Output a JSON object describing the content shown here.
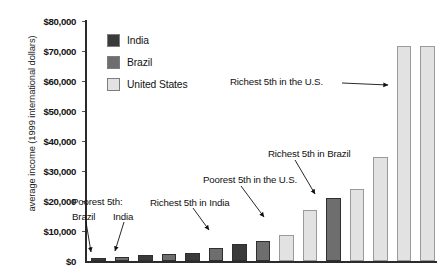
{
  "chart_data": {
    "type": "bar",
    "title": "",
    "xlabel": "",
    "ylabel": "average income (1999 international dollars)",
    "ylim": [
      0,
      80000
    ],
    "ytick_labels": [
      "$0",
      "$10,000",
      "$20,000",
      "$30,000",
      "$40,000",
      "$50,000",
      "$60,000",
      "$70,000",
      "$80,000"
    ],
    "ytick_values": [
      0,
      10000,
      20000,
      30000,
      40000,
      50000,
      60000,
      70000,
      80000
    ],
    "grid": false,
    "legend_position": "top-left",
    "legend": [
      {
        "name": "India",
        "color": "#3a3a3a"
      },
      {
        "name": "Brazil",
        "color": "#6e6e6e"
      },
      {
        "name": "United States",
        "color": "#e2e2e2"
      }
    ],
    "categories": [
      "1",
      "2",
      "3",
      "4",
      "5",
      "6",
      "7",
      "8",
      "9",
      "10",
      "11",
      "12",
      "13",
      "14",
      "15"
    ],
    "values": [
      900,
      1400,
      1900,
      2400,
      2600,
      4200,
      5700,
      6700,
      8400,
      16800,
      20800,
      24000,
      34500,
      71500,
      71500
    ],
    "bars": [
      {
        "series": "India",
        "value": 900,
        "color": "#3a3a3a"
      },
      {
        "series": "Brazil",
        "value": 1400,
        "color": "#6e6e6e"
      },
      {
        "series": "India",
        "value": 1900,
        "color": "#3a3a3a"
      },
      {
        "series": "Brazil",
        "value": 2400,
        "color": "#6e6e6e"
      },
      {
        "series": "India",
        "value": 2700,
        "color": "#3a3a3a"
      },
      {
        "series": "Brazil",
        "value": 4300,
        "color": "#6e6e6e"
      },
      {
        "series": "India",
        "value": 5800,
        "color": "#3a3a3a"
      },
      {
        "series": "Brazil",
        "value": 6800,
        "color": "#6e6e6e"
      },
      {
        "series": "United States",
        "value": 8500,
        "color": "#e2e2e2"
      },
      {
        "series": "United States",
        "value": 16800,
        "color": "#e2e2e2"
      },
      {
        "series": "Brazil",
        "value": 20900,
        "color": "#6e6e6e"
      },
      {
        "series": "United States",
        "value": 24000,
        "color": "#e2e2e2"
      },
      {
        "series": "United States",
        "value": 34500,
        "color": "#e2e2e2"
      },
      {
        "series": "United States",
        "value": 71500,
        "color": "#e2e2e2"
      },
      {
        "series": "United States",
        "value": 71500,
        "color": "#e2e2e2"
      }
    ],
    "annotations": [
      {
        "text": "Poorest 5th:",
        "target_bar": 1
      },
      {
        "text": "Brazil",
        "target_bar": 1
      },
      {
        "text": "India",
        "target_bar": 2
      },
      {
        "text": "Richest 5th in India",
        "target_bar": 7
      },
      {
        "text": "Poorest 5th in the U.S.",
        "target_bar": 9
      },
      {
        "text": "Richest 5th in Brazil",
        "target_bar": 11
      },
      {
        "text": "Richest 5th in the U.S.",
        "target_bar": 14
      }
    ]
  }
}
